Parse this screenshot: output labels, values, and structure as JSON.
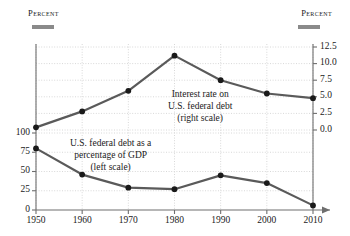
{
  "header": {
    "left_axis_title": "Percent",
    "right_axis_title": "Percent"
  },
  "annotations": {
    "interest": {
      "line1": "Interest rate on",
      "line2": "U.S. federal debt",
      "line3": "(right scale)"
    },
    "debt": {
      "line1": "U.S. federal debt as a",
      "line2": "percentage of GDP",
      "line3": "(left scale)"
    }
  },
  "chart_data": {
    "type": "line",
    "title": "",
    "subtitle": "",
    "xlabel": "",
    "ylabel": "Percent",
    "y2label": "Percent",
    "grid": true,
    "legend_position": "inline-annotation",
    "x": [
      1950,
      1960,
      1970,
      1980,
      1990,
      2000,
      2010
    ],
    "xtick_labels": [
      "1950",
      "1960",
      "1970",
      "1980",
      "1990",
      "2000",
      "2010"
    ],
    "xlim": [
      1950,
      2010
    ],
    "left_axis": {
      "label": "Percent",
      "ylim": [
        0,
        112.5
      ],
      "ticks": [
        0,
        25,
        50,
        75,
        100
      ],
      "tick_labels": [
        "0",
        "25",
        "50",
        "75",
        "100"
      ]
    },
    "right_axis": {
      "label": "Percent",
      "ylim": [
        -5.0,
        12.5
      ],
      "ticks": [
        0.0,
        2.5,
        5.0,
        7.5,
        10.0,
        12.5
      ],
      "tick_labels": [
        "0.0",
        "2.5",
        "5.0",
        "7.5",
        "10.0",
        "12.5"
      ]
    },
    "series": [
      {
        "name": "U.S. federal debt as a percentage of GDP",
        "scale": "left",
        "values": [
          80,
          46,
          29,
          27,
          45,
          35,
          6
        ],
        "color": "#5a5a5a",
        "marker_color": "#1a1a1a"
      },
      {
        "name": "Interest rate on U.S. federal debt",
        "scale": "right",
        "values": [
          0.4,
          2.8,
          5.9,
          11.2,
          7.5,
          5.5,
          4.8
        ],
        "color": "#5a5a5a",
        "marker_color": "#1a1a1a"
      }
    ],
    "colors": {
      "line": "#5a5a5a",
      "marker": "#1a1a1a",
      "grid": "#d8d8d8",
      "axis": "#6e6e6e",
      "rule": "#8a8a8a"
    }
  }
}
